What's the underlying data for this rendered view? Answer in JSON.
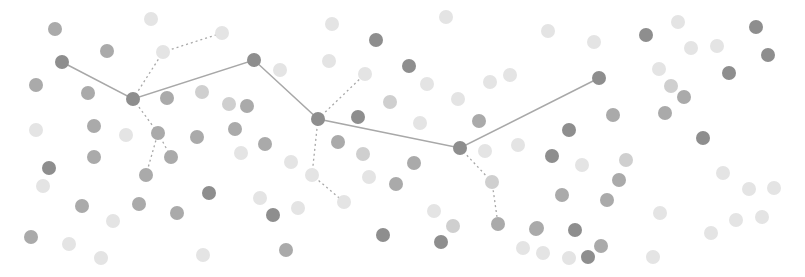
{
  "scene": {
    "width": 805,
    "height": 277,
    "background": "#ffffff",
    "node_radius": 7,
    "colors": {
      "dark": "#8e8e8e",
      "mid": "#aaaaaa",
      "light": "#cfcfcf",
      "faint": "#e4e4e4",
      "edge": "#a8a8a8"
    }
  },
  "main_path": [
    {
      "x": 62,
      "y": 62
    },
    {
      "x": 133,
      "y": 99
    },
    {
      "x": 254,
      "y": 60
    },
    {
      "x": 318,
      "y": 119
    },
    {
      "x": 460,
      "y": 148
    },
    {
      "x": 599,
      "y": 78
    }
  ],
  "branches": [
    [
      {
        "x": 133,
        "y": 99
      },
      {
        "x": 163,
        "y": 52
      },
      {
        "x": 222,
        "y": 33
      }
    ],
    [
      {
        "x": 133,
        "y": 99
      },
      {
        "x": 158,
        "y": 133
      },
      {
        "x": 146,
        "y": 175
      }
    ],
    [
      {
        "x": 158,
        "y": 133
      },
      {
        "x": 171,
        "y": 157
      }
    ],
    [
      {
        "x": 318,
        "y": 119
      },
      {
        "x": 365,
        "y": 74
      }
    ],
    [
      {
        "x": 318,
        "y": 119
      },
      {
        "x": 312,
        "y": 175
      },
      {
        "x": 344,
        "y": 202
      }
    ],
    [
      {
        "x": 460,
        "y": 148
      },
      {
        "x": 492,
        "y": 182
      },
      {
        "x": 498,
        "y": 224
      }
    ]
  ],
  "nodes": [
    {
      "x": 62,
      "y": 62,
      "tone": "dark"
    },
    {
      "x": 133,
      "y": 99,
      "tone": "dark"
    },
    {
      "x": 254,
      "y": 60,
      "tone": "dark"
    },
    {
      "x": 318,
      "y": 119,
      "tone": "dark"
    },
    {
      "x": 460,
      "y": 148,
      "tone": "dark"
    },
    {
      "x": 599,
      "y": 78,
      "tone": "dark"
    },
    {
      "x": 55,
      "y": 29,
      "tone": "mid"
    },
    {
      "x": 151,
      "y": 19,
      "tone": "faint"
    },
    {
      "x": 107,
      "y": 51,
      "tone": "mid"
    },
    {
      "x": 163,
      "y": 52,
      "tone": "faint"
    },
    {
      "x": 222,
      "y": 33,
      "tone": "faint"
    },
    {
      "x": 36,
      "y": 85,
      "tone": "mid"
    },
    {
      "x": 88,
      "y": 93,
      "tone": "mid"
    },
    {
      "x": 167,
      "y": 98,
      "tone": "mid"
    },
    {
      "x": 202,
      "y": 92,
      "tone": "light"
    },
    {
      "x": 229,
      "y": 104,
      "tone": "light"
    },
    {
      "x": 247,
      "y": 106,
      "tone": "mid"
    },
    {
      "x": 36,
      "y": 130,
      "tone": "faint"
    },
    {
      "x": 94,
      "y": 126,
      "tone": "mid"
    },
    {
      "x": 126,
      "y": 135,
      "tone": "faint"
    },
    {
      "x": 158,
      "y": 133,
      "tone": "mid"
    },
    {
      "x": 197,
      "y": 137,
      "tone": "mid"
    },
    {
      "x": 235,
      "y": 129,
      "tone": "mid"
    },
    {
      "x": 265,
      "y": 144,
      "tone": "mid"
    },
    {
      "x": 94,
      "y": 157,
      "tone": "mid"
    },
    {
      "x": 171,
      "y": 157,
      "tone": "mid"
    },
    {
      "x": 241,
      "y": 153,
      "tone": "faint"
    },
    {
      "x": 49,
      "y": 168,
      "tone": "dark"
    },
    {
      "x": 146,
      "y": 175,
      "tone": "mid"
    },
    {
      "x": 43,
      "y": 186,
      "tone": "faint"
    },
    {
      "x": 209,
      "y": 193,
      "tone": "dark"
    },
    {
      "x": 260,
      "y": 198,
      "tone": "faint"
    },
    {
      "x": 82,
      "y": 206,
      "tone": "mid"
    },
    {
      "x": 139,
      "y": 204,
      "tone": "mid"
    },
    {
      "x": 177,
      "y": 213,
      "tone": "mid"
    },
    {
      "x": 113,
      "y": 221,
      "tone": "faint"
    },
    {
      "x": 31,
      "y": 237,
      "tone": "mid"
    },
    {
      "x": 69,
      "y": 244,
      "tone": "faint"
    },
    {
      "x": 101,
      "y": 258,
      "tone": "faint"
    },
    {
      "x": 203,
      "y": 255,
      "tone": "faint"
    },
    {
      "x": 332,
      "y": 24,
      "tone": "faint"
    },
    {
      "x": 376,
      "y": 40,
      "tone": "dark"
    },
    {
      "x": 446,
      "y": 17,
      "tone": "faint"
    },
    {
      "x": 329,
      "y": 61,
      "tone": "faint"
    },
    {
      "x": 365,
      "y": 74,
      "tone": "faint"
    },
    {
      "x": 409,
      "y": 66,
      "tone": "dark"
    },
    {
      "x": 280,
      "y": 70,
      "tone": "faint"
    },
    {
      "x": 427,
      "y": 84,
      "tone": "faint"
    },
    {
      "x": 458,
      "y": 99,
      "tone": "faint"
    },
    {
      "x": 490,
      "y": 82,
      "tone": "faint"
    },
    {
      "x": 510,
      "y": 75,
      "tone": "faint"
    },
    {
      "x": 390,
      "y": 102,
      "tone": "light"
    },
    {
      "x": 358,
      "y": 117,
      "tone": "dark"
    },
    {
      "x": 420,
      "y": 123,
      "tone": "faint"
    },
    {
      "x": 479,
      "y": 121,
      "tone": "mid"
    },
    {
      "x": 518,
      "y": 145,
      "tone": "faint"
    },
    {
      "x": 338,
      "y": 142,
      "tone": "mid"
    },
    {
      "x": 291,
      "y": 162,
      "tone": "faint"
    },
    {
      "x": 363,
      "y": 154,
      "tone": "light"
    },
    {
      "x": 414,
      "y": 163,
      "tone": "mid"
    },
    {
      "x": 312,
      "y": 175,
      "tone": "faint"
    },
    {
      "x": 369,
      "y": 177,
      "tone": "faint"
    },
    {
      "x": 396,
      "y": 184,
      "tone": "mid"
    },
    {
      "x": 485,
      "y": 151,
      "tone": "faint"
    },
    {
      "x": 492,
      "y": 182,
      "tone": "light"
    },
    {
      "x": 344,
      "y": 202,
      "tone": "faint"
    },
    {
      "x": 273,
      "y": 215,
      "tone": "dark"
    },
    {
      "x": 298,
      "y": 208,
      "tone": "faint"
    },
    {
      "x": 434,
      "y": 211,
      "tone": "faint"
    },
    {
      "x": 453,
      "y": 226,
      "tone": "light"
    },
    {
      "x": 498,
      "y": 224,
      "tone": "mid"
    },
    {
      "x": 383,
      "y": 235,
      "tone": "dark"
    },
    {
      "x": 441,
      "y": 242,
      "tone": "dark"
    },
    {
      "x": 286,
      "y": 250,
      "tone": "mid"
    },
    {
      "x": 523,
      "y": 248,
      "tone": "faint"
    },
    {
      "x": 536,
      "y": 229,
      "tone": "mid"
    },
    {
      "x": 548,
      "y": 31,
      "tone": "faint"
    },
    {
      "x": 594,
      "y": 42,
      "tone": "faint"
    },
    {
      "x": 646,
      "y": 35,
      "tone": "dark"
    },
    {
      "x": 678,
      "y": 22,
      "tone": "faint"
    },
    {
      "x": 691,
      "y": 48,
      "tone": "faint"
    },
    {
      "x": 717,
      "y": 46,
      "tone": "faint"
    },
    {
      "x": 756,
      "y": 27,
      "tone": "dark"
    },
    {
      "x": 768,
      "y": 55,
      "tone": "dark"
    },
    {
      "x": 729,
      "y": 73,
      "tone": "dark"
    },
    {
      "x": 659,
      "y": 69,
      "tone": "faint"
    },
    {
      "x": 671,
      "y": 86,
      "tone": "light"
    },
    {
      "x": 684,
      "y": 97,
      "tone": "mid"
    },
    {
      "x": 613,
      "y": 115,
      "tone": "mid"
    },
    {
      "x": 665,
      "y": 113,
      "tone": "mid"
    },
    {
      "x": 569,
      "y": 130,
      "tone": "dark"
    },
    {
      "x": 703,
      "y": 138,
      "tone": "dark"
    },
    {
      "x": 552,
      "y": 156,
      "tone": "dark"
    },
    {
      "x": 582,
      "y": 165,
      "tone": "faint"
    },
    {
      "x": 626,
      "y": 160,
      "tone": "light"
    },
    {
      "x": 619,
      "y": 180,
      "tone": "mid"
    },
    {
      "x": 723,
      "y": 173,
      "tone": "faint"
    },
    {
      "x": 749,
      "y": 189,
      "tone": "faint"
    },
    {
      "x": 774,
      "y": 188,
      "tone": "faint"
    },
    {
      "x": 562,
      "y": 195,
      "tone": "mid"
    },
    {
      "x": 607,
      "y": 200,
      "tone": "mid"
    },
    {
      "x": 660,
      "y": 213,
      "tone": "faint"
    },
    {
      "x": 736,
      "y": 220,
      "tone": "faint"
    },
    {
      "x": 762,
      "y": 217,
      "tone": "faint"
    },
    {
      "x": 537,
      "y": 228,
      "tone": "mid"
    },
    {
      "x": 575,
      "y": 230,
      "tone": "dark"
    },
    {
      "x": 711,
      "y": 233,
      "tone": "faint"
    },
    {
      "x": 601,
      "y": 246,
      "tone": "mid"
    },
    {
      "x": 543,
      "y": 253,
      "tone": "faint"
    },
    {
      "x": 588,
      "y": 257,
      "tone": "dark"
    },
    {
      "x": 569,
      "y": 258,
      "tone": "faint"
    },
    {
      "x": 653,
      "y": 257,
      "tone": "faint"
    }
  ]
}
